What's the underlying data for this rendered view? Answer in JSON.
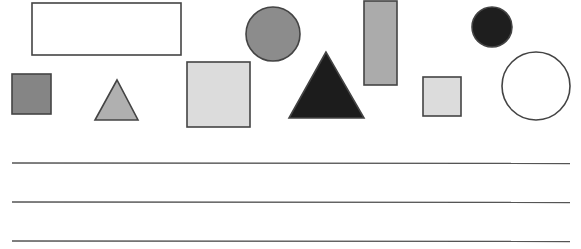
{
  "canvas": {
    "width": 581,
    "height": 249,
    "background": "#ffffff"
  },
  "stroke": "#444444",
  "shapes": [
    {
      "name": "white-rectangle",
      "type": "rect",
      "x": 32,
      "y": 3,
      "w": 149,
      "h": 52,
      "fill": "#ffffff"
    },
    {
      "name": "gray-circle",
      "type": "circle",
      "cx": 273,
      "cy": 34,
      "r": 27,
      "fill": "#8c8c8c"
    },
    {
      "name": "tall-gray-rectangle",
      "type": "rect",
      "x": 364,
      "y": 1,
      "w": 33,
      "h": 84,
      "fill": "#ababab"
    },
    {
      "name": "black-circle",
      "type": "circle",
      "cx": 492,
      "cy": 27,
      "r": 20,
      "fill": "#1e1e1e"
    },
    {
      "name": "dark-gray-square",
      "type": "rect",
      "x": 12,
      "y": 74,
      "w": 39,
      "h": 40,
      "fill": "#858585"
    },
    {
      "name": "gray-triangle",
      "type": "triangle",
      "points": "117,80 95,120 138,120",
      "fill": "#b0b0b0"
    },
    {
      "name": "light-gray-square",
      "type": "rect",
      "x": 187,
      "y": 62,
      "w": 63,
      "h": 65,
      "fill": "#dcdcdc"
    },
    {
      "name": "black-triangle",
      "type": "triangle",
      "points": "326,52 289,118 364,118",
      "fill": "#1c1c1c"
    },
    {
      "name": "small-light-square",
      "type": "rect",
      "x": 423,
      "y": 77,
      "w": 38,
      "h": 39,
      "fill": "#dcdcdc"
    },
    {
      "name": "white-circle",
      "type": "circle",
      "cx": 536,
      "cy": 86,
      "r": 34,
      "fill": "#ffffff"
    }
  ],
  "answer_lines": [
    {
      "x1": 12,
      "x2": 570,
      "y": 163
    },
    {
      "x1": 12,
      "x2": 570,
      "y": 202
    },
    {
      "x1": 12,
      "x2": 570,
      "y": 241
    }
  ]
}
